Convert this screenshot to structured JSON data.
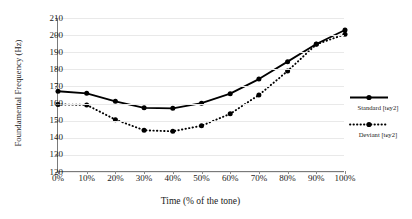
{
  "chart_data": {
    "type": "line",
    "title": "",
    "xlabel": "Time (% of the tone)",
    "ylabel": "Foundamental Frequency (Hz)",
    "categories": [
      "0%",
      "10%",
      "20%",
      "30%",
      "40%",
      "50%",
      "60%",
      "70%",
      "80%",
      "90%",
      "100%"
    ],
    "x": [
      0,
      10,
      20,
      30,
      40,
      50,
      60,
      70,
      80,
      90,
      100
    ],
    "ylim": [
      120,
      210
    ],
    "yticks": [
      120,
      130,
      140,
      150,
      160,
      170,
      180,
      190,
      200,
      210
    ],
    "grid": true,
    "legend_position": "right",
    "series": [
      {
        "name": "Standard [tɕy2]",
        "style": "solid",
        "marker": "circle",
        "values": [
          167.2,
          166.0,
          161.3,
          157.5,
          157.2,
          160.2,
          165.8,
          174.3,
          184.5,
          194.8,
          203.0
        ]
      },
      {
        "name": "Deviant [tɕy2]",
        "style": "dotted",
        "marker": "circle",
        "values": [
          159.5,
          159.2,
          150.6,
          144.4,
          143.8,
          147.0,
          154.0,
          165.0,
          179.0,
          194.6,
          200.5
        ]
      }
    ]
  },
  "axes": {
    "y_title": "Foundamental Frequency (Hz)",
    "x_title": "Time (% of the tone)",
    "y_tick_labels": [
      "210",
      "200",
      "190",
      "180",
      "170",
      "160",
      "150",
      "140",
      "130",
      "120"
    ],
    "x_tick_labels": [
      "0%",
      "10%",
      "20%",
      "30%",
      "40%",
      "50%",
      "60%",
      "70%",
      "80%",
      "90%",
      "100%"
    ]
  },
  "legend": {
    "items": [
      {
        "label": "Standard [tɕy2]",
        "style": "solid"
      },
      {
        "label": "Deviant [tɕy2]",
        "style": "dotted"
      }
    ]
  },
  "colors": {
    "series_line": "#000000",
    "axis": "#7a7a7a",
    "grid": "#e9e9e9",
    "text": "#1a1a1a",
    "background": "#ffffff"
  }
}
